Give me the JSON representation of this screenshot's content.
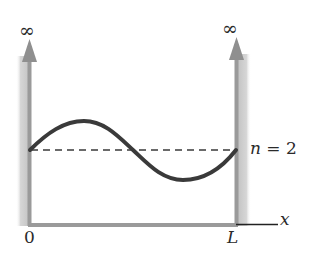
{
  "diagram": {
    "left_wall": {
      "label": "∞"
    },
    "right_wall": {
      "label": "∞"
    },
    "origin_label": "0",
    "right_edge_label": "L",
    "axis_label": "x",
    "state_label": "n = 2",
    "state_label_var": "n",
    "state_label_value": "= 2",
    "colors": {
      "wall": "#9a9a9a",
      "wall_shadow": "#d0d0d0",
      "wave": "#3a3a3a",
      "dashed_line": "#3a3a3a",
      "axis": "#222222",
      "text": "#2a2a2a"
    }
  }
}
